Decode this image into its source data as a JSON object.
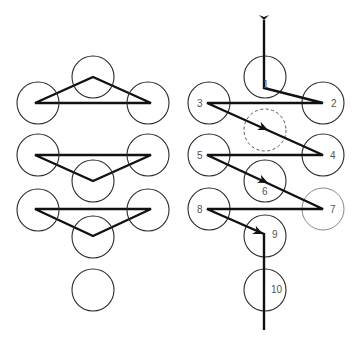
{
  "diagram": {
    "left_panel": {
      "description": "Three pin groups drawn as triangles plus one lone circle",
      "circle_radius": 21,
      "circles": [
        {
          "id": "L-top-mid",
          "cx": 93,
          "cy": 77
        },
        {
          "id": "L-top-left",
          "cx": 38,
          "cy": 103
        },
        {
          "id": "L-top-right",
          "cx": 148,
          "cy": 103
        },
        {
          "id": "L-mid-left",
          "cx": 38,
          "cy": 155
        },
        {
          "id": "L-mid-right",
          "cx": 148,
          "cy": 155
        },
        {
          "id": "L-mid-mid",
          "cx": 93,
          "cy": 181
        },
        {
          "id": "L-low-left",
          "cx": 38,
          "cy": 210
        },
        {
          "id": "L-low-right",
          "cx": 148,
          "cy": 210
        },
        {
          "id": "L-low-mid",
          "cx": 93,
          "cy": 237
        },
        {
          "id": "L-bottom",
          "cx": 93,
          "cy": 290
        }
      ],
      "triangles": [
        "35,103 93,77 151,103",
        "35,155 151,155 93,181",
        "35,209 151,209 93,236"
      ]
    },
    "right_panel": {
      "description": "Numbered sequence 1-10 with a zig-zag path and arrows",
      "circle_radius": 21,
      "circles": [
        {
          "label": "1",
          "cx": 265,
          "cy": 77,
          "lx": 263,
          "ly": 88,
          "style": "solid"
        },
        {
          "label": "2",
          "cx": 323,
          "cy": 103,
          "lx": 331,
          "ly": 107,
          "style": "solid"
        },
        {
          "label": "3",
          "cx": 209,
          "cy": 103,
          "lx": 197,
          "ly": 107,
          "style": "solid"
        },
        {
          "label": "",
          "cx": 265,
          "cy": 130,
          "lx": 0,
          "ly": 0,
          "style": "dashed"
        },
        {
          "label": "4",
          "cx": 323,
          "cy": 155,
          "lx": 330,
          "ly": 159,
          "style": "solid"
        },
        {
          "label": "5",
          "cx": 209,
          "cy": 155,
          "lx": 197,
          "ly": 159,
          "style": "solid"
        },
        {
          "label": "6",
          "cx": 265,
          "cy": 181,
          "lx": 262,
          "ly": 195,
          "style": "solid"
        },
        {
          "label": "7",
          "cx": 323,
          "cy": 209,
          "lx": 330,
          "ly": 213,
          "style": "light"
        },
        {
          "label": "8",
          "cx": 209,
          "cy": 209,
          "lx": 197,
          "ly": 213,
          "style": "solid"
        },
        {
          "label": "9",
          "cx": 265,
          "cy": 236,
          "lx": 272,
          "ly": 238,
          "style": "solid"
        },
        {
          "label": "10",
          "cx": 265,
          "cy": 290,
          "lx": 271,
          "ly": 293,
          "style": "solid"
        }
      ],
      "path_points": "264,20 264,88 323,103 207,103 323,155 207,155 323,209 207,209 264,234 264,330",
      "arrows": [
        {
          "name": "arrow-entry",
          "x": 264,
          "y": 20,
          "angle": 90
        },
        {
          "name": "arrow-3-to-4",
          "x": 268,
          "y": 130,
          "angle": 24
        },
        {
          "name": "arrow-5-to-6",
          "x": 268,
          "y": 183,
          "angle": 25
        },
        {
          "name": "arrow-8-to-9",
          "x": 263,
          "y": 234,
          "angle": 24
        }
      ]
    }
  }
}
